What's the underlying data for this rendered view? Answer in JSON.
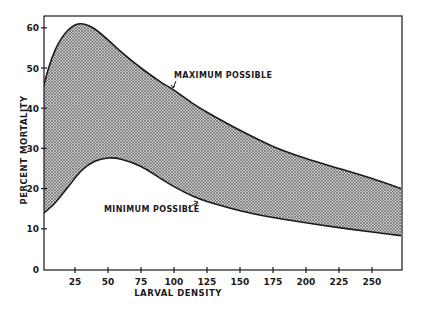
{
  "chart_data": {
    "type": "area",
    "title": "",
    "xlabel": "LARVAL DENSITY",
    "ylabel": "PERCENT MORTALITY",
    "xlim": [
      0,
      272
    ],
    "ylim": [
      0,
      63
    ],
    "xticks": [
      25,
      50,
      75,
      100,
      125,
      150,
      175,
      200,
      225,
      250
    ],
    "yticks": [
      0,
      10,
      20,
      30,
      40,
      50,
      60
    ],
    "grid": false,
    "legend": null,
    "series": [
      {
        "name": "MAXIMUM POSSIBLE",
        "x": [
          0,
          5,
          10,
          15,
          20,
          25,
          30,
          35,
          40,
          50,
          60,
          75,
          90,
          100,
          115,
          125,
          150,
          175,
          200,
          225,
          250,
          272
        ],
        "values": [
          44,
          50,
          54.5,
          57.5,
          59.5,
          60.7,
          61,
          60.6,
          59.7,
          57,
          54,
          50,
          46.5,
          44.5,
          41,
          39,
          34.5,
          30.5,
          27.5,
          25,
          22.5,
          20
        ]
      },
      {
        "name": "MINIMUM POSSIBLE",
        "x": [
          0,
          10,
          20,
          30,
          40,
          50,
          60,
          75,
          90,
          100,
          115,
          125,
          150,
          175,
          200,
          225,
          250,
          272
        ],
        "values": [
          13.5,
          16.5,
          20.5,
          24.5,
          26.8,
          27.6,
          27.3,
          25.5,
          22.5,
          20.5,
          18,
          16.8,
          14.5,
          12.8,
          11.5,
          10.3,
          9.2,
          8.3
        ]
      }
    ],
    "fill_between": [
      "MAXIMUM POSSIBLE",
      "MINIMUM POSSIBLE"
    ],
    "annotations": [
      {
        "text": "MAXIMUM POSSIBLE",
        "points_to": "MAXIMUM POSSIBLE",
        "near_x": 100
      },
      {
        "text": "MINIMUM POSSIBLE",
        "points_to": "MINIMUM POSSIBLE",
        "near_x": 112
      }
    ]
  },
  "labels": {
    "xlabel": "LARVAL DENSITY",
    "ylabel": "PERCENT MORTALITY",
    "max_annot": "MAXIMUM POSSIBLE",
    "min_annot": "MINIMUM POSSIBLE"
  },
  "colors": {
    "ink": "#1a1a1a",
    "fill_dot": "#2a2a2a",
    "fill_bg": "#bdbdbd",
    "background": "#ffffff"
  }
}
